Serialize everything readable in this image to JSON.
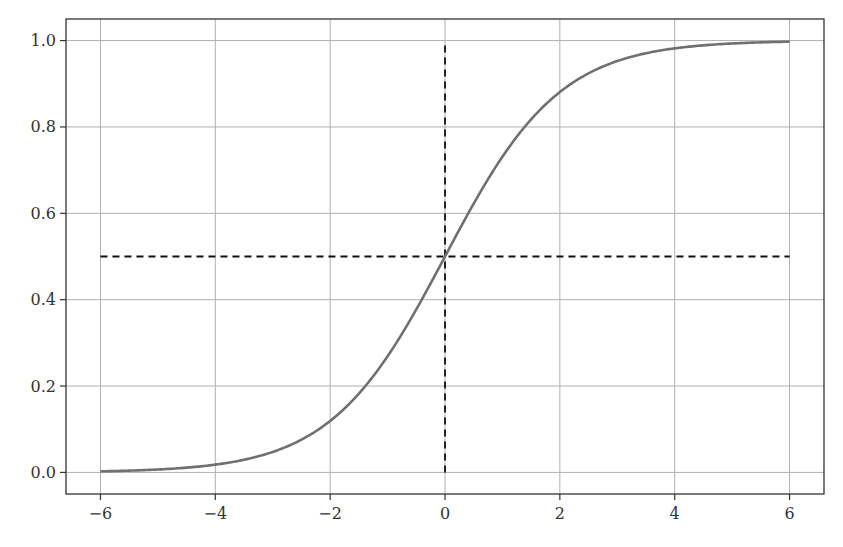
{
  "chart_data": {
    "type": "line",
    "title": "",
    "xlabel": "",
    "ylabel": "",
    "xlim": [
      -6.6,
      6.6
    ],
    "ylim": [
      -0.05,
      1.05
    ],
    "grid": true,
    "legend": null,
    "x_ticks": [
      "−6",
      "−4",
      "−2",
      "0",
      "2",
      "4",
      "6"
    ],
    "x_tick_values": [
      -6,
      -4,
      -2,
      0,
      2,
      4,
      6
    ],
    "y_ticks": [
      "0.0",
      "0.2",
      "0.4",
      "0.6",
      "0.8",
      "1.0"
    ],
    "y_tick_values": [
      0.0,
      0.2,
      0.4,
      0.6,
      0.8,
      1.0
    ],
    "series": [
      {
        "name": "sigmoid",
        "function": "1/(1+exp(-x))",
        "color": "#707070",
        "style": "solid",
        "x": [
          -6,
          -5,
          -4,
          -3,
          -2,
          -1,
          0,
          1,
          2,
          3,
          4,
          5,
          6
        ],
        "y": [
          0.0025,
          0.0067,
          0.018,
          0.047,
          0.119,
          0.269,
          0.5,
          0.731,
          0.881,
          0.953,
          0.982,
          0.993,
          0.9975
        ]
      },
      {
        "name": "horizontal-reference",
        "color": "#111111",
        "style": "dashed",
        "x": [
          -6,
          6
        ],
        "y": [
          0.5,
          0.5
        ]
      },
      {
        "name": "vertical-reference",
        "color": "#111111",
        "style": "dashed",
        "x": [
          0,
          0
        ],
        "y": [
          0.0,
          1.0
        ]
      }
    ]
  },
  "colors": {
    "curve": "#707070",
    "reference": "#111111",
    "grid": "#b0b0b0",
    "axes": "#333333"
  }
}
